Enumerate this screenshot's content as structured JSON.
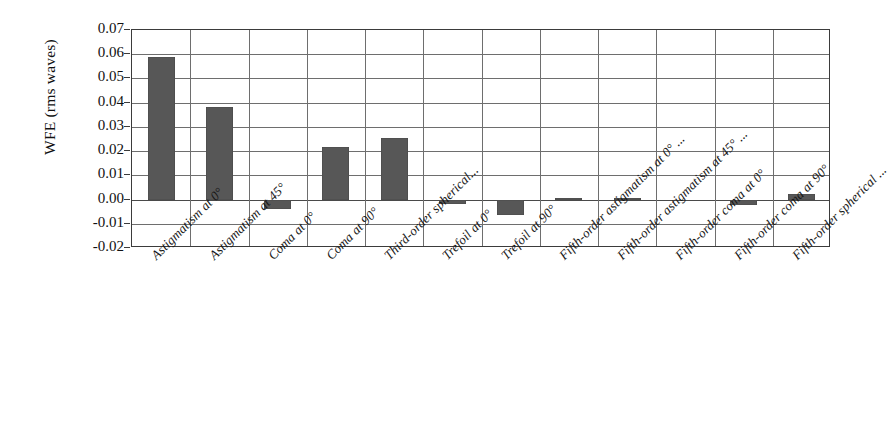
{
  "chart_data": {
    "type": "bar",
    "title": "",
    "xlabel": "",
    "ylabel": "WFE (rms waves)",
    "ylim": [
      -0.02,
      0.07
    ],
    "yticks": [
      "0.07",
      "0.06",
      "0.05",
      "0.04",
      "0.03",
      "0.02",
      "0.01",
      "0.00",
      "-0.01",
      "-0.02"
    ],
    "ytick_values": [
      0.07,
      0.06,
      0.05,
      0.04,
      0.03,
      0.02,
      0.01,
      0.0,
      -0.01,
      -0.02
    ],
    "grid": true,
    "legend": "none",
    "categories": [
      "Astigmatism at 0°",
      "Astigmatism at 45°",
      "Coma at 0°",
      "Coma at 90°",
      "Third-order spherical...",
      "Trefoil at 0°",
      "Trefoil at 90°",
      "Fifth-order astigmatism at 0° ...",
      "Fifth-order astigmatism at 45° ...",
      "Fifth-order coma at 0°",
      "Fifth-order coma at 90°",
      "Fifth-order spherical ..."
    ],
    "values": [
      0.0587,
      0.0383,
      -0.0038,
      0.0215,
      0.0255,
      -0.0017,
      -0.0062,
      0.0008,
      0.0006,
      0.0,
      -0.0022,
      0.0023
    ],
    "bar_color": "#575757",
    "axis_color": "#3b3b3b",
    "grid_color": "#6e6e6e"
  }
}
